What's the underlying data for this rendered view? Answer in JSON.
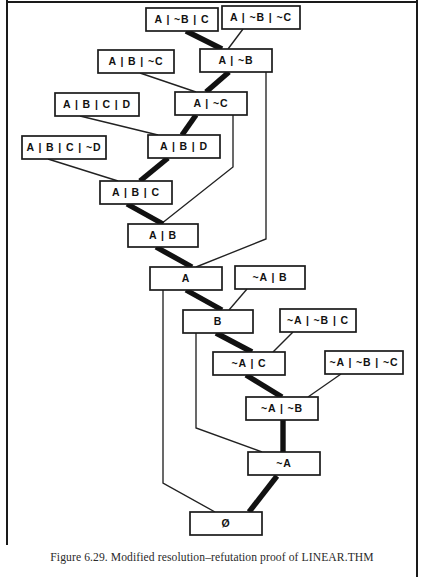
{
  "figure": {
    "caption": "Figure 6.29. Modified resolution–refutation proof of LINEAR.THM",
    "colors": {
      "ink": "#111111",
      "box_fill": "#ffffff",
      "box_stroke": "#1a1a1a",
      "thick_edge": "#111111",
      "thin_edge": "#222222",
      "page_background": "#ffffff"
    }
  },
  "chart_data": {
    "type": "diagram",
    "title": "Modified resolution–refutation proof of LINEAR.THM",
    "nodes": [
      {
        "id": "n1",
        "label": "A | ~B | C",
        "x": 146,
        "y": 8,
        "w": 72,
        "h": 23
      },
      {
        "id": "n2",
        "label": "A | ~B | ~C",
        "x": 222,
        "y": 6,
        "w": 78,
        "h": 23
      },
      {
        "id": "n3",
        "label": "A | B | ~C",
        "x": 98,
        "y": 50,
        "w": 76,
        "h": 23
      },
      {
        "id": "n4",
        "label": "A | ~B",
        "x": 200,
        "y": 49,
        "w": 72,
        "h": 23
      },
      {
        "id": "n5",
        "label": "A | B | C | D",
        "x": 55,
        "y": 93,
        "w": 84,
        "h": 23
      },
      {
        "id": "n6",
        "label": "A | ~C",
        "x": 175,
        "y": 92,
        "w": 72,
        "h": 23
      },
      {
        "id": "n7",
        "label": "A | B | C | ~D",
        "x": 22,
        "y": 136,
        "w": 84,
        "h": 23
      },
      {
        "id": "n8",
        "label": "A | B | D",
        "x": 148,
        "y": 135,
        "w": 72,
        "h": 23
      },
      {
        "id": "n9",
        "label": "A | B | C",
        "x": 100,
        "y": 181,
        "w": 72,
        "h": 23
      },
      {
        "id": "n10",
        "label": "A | B",
        "x": 128,
        "y": 224,
        "w": 70,
        "h": 23
      },
      {
        "id": "n11",
        "label": "A",
        "x": 150,
        "y": 267,
        "w": 72,
        "h": 23
      },
      {
        "id": "n12",
        "label": "~A | B",
        "x": 235,
        "y": 266,
        "w": 70,
        "h": 23
      },
      {
        "id": "n13",
        "label": "B",
        "x": 183,
        "y": 310,
        "w": 70,
        "h": 23
      },
      {
        "id": "n14",
        "label": "~A | ~B | C",
        "x": 280,
        "y": 309,
        "w": 76,
        "h": 23
      },
      {
        "id": "n15",
        "label": "~A | C",
        "x": 213,
        "y": 352,
        "w": 72,
        "h": 23
      },
      {
        "id": "n16",
        "label": "~A | ~B | ~C",
        "x": 325,
        "y": 351,
        "w": 78,
        "h": 23
      },
      {
        "id": "n17",
        "label": "~A | ~B",
        "x": 246,
        "y": 397,
        "w": 72,
        "h": 23
      },
      {
        "id": "n18",
        "label": "~A",
        "x": 248,
        "y": 452,
        "w": 72,
        "h": 23
      },
      {
        "id": "n19",
        "label": "Ø",
        "x": 190,
        "y": 512,
        "w": 72,
        "h": 23
      }
    ],
    "thick_edges": [
      {
        "from": "n1",
        "to": "n4",
        "points": "186,31 222,49"
      },
      {
        "from": "n4",
        "to": "n6",
        "points": "229,72 206,92"
      },
      {
        "from": "n6",
        "to": "n8",
        "points": "196,115 182,135"
      },
      {
        "from": "n8",
        "to": "n9",
        "points": "168,158 140,181"
      },
      {
        "from": "n9",
        "to": "n10",
        "points": "127,204 163,224"
      },
      {
        "from": "n10",
        "to": "n11",
        "points": "156,247 192,267"
      },
      {
        "from": "n11",
        "to": "n13",
        "points": "186,290 222,310"
      },
      {
        "from": "n13",
        "to": "n15",
        "points": "216,333 252,352"
      },
      {
        "from": "n15",
        "to": "n17",
        "points": "246,375 282,397"
      },
      {
        "from": "n17",
        "to": "n18",
        "points": "283,420 283,452"
      },
      {
        "from": "n18",
        "to": "n19",
        "points": "277,476 249,512"
      }
    ],
    "thin_edges": [
      {
        "from": "n2",
        "to": "n4",
        "points": "243,29 228,49"
      },
      {
        "from": "n3",
        "to": "n6",
        "points": "140,73 196,92"
      },
      {
        "from": "n5",
        "to": "n8",
        "points": "80,116 158,135"
      },
      {
        "from": "n7",
        "to": "n9",
        "points": "48,159 118,181"
      },
      {
        "from": "n4",
        "to": "n11",
        "points": "266,72 266,239 196,267"
      },
      {
        "from": "n6",
        "to": "n10",
        "points": "233,115 233,167 161,224"
      },
      {
        "from": "n12",
        "to": "n13",
        "points": "247,289 229,310"
      },
      {
        "from": "n14",
        "to": "n15",
        "points": "293,332 273,352"
      },
      {
        "from": "n16",
        "to": "n17",
        "points": "341,374 308,397"
      },
      {
        "from": "n13",
        "to": "n18",
        "points": "196,333 196,428 262,452"
      },
      {
        "from": "n11",
        "to": "n19",
        "points": "163,290 163,483 215,512"
      }
    ],
    "layout_hint": "Proof tree: clauses resolved top-to-bottom along a thick spine to the empty clause Ø; thin lines are side-clause inputs."
  }
}
